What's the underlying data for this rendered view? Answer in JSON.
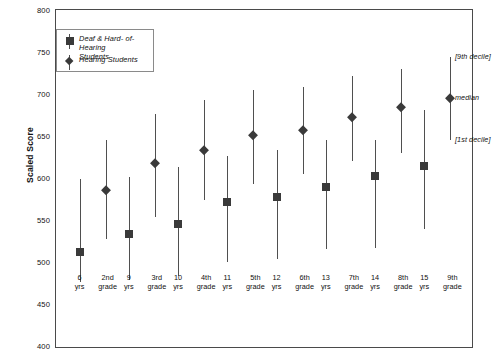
{
  "chart_data": {
    "type": "scatter",
    "title": "",
    "xlabel": "",
    "ylabel": "Scaled Score",
    "ylim": [
      400,
      800
    ],
    "ytick_labels": [
      "800",
      "750",
      "700",
      "650",
      "600",
      "550",
      "500",
      "450",
      "400"
    ],
    "ytick_values": [
      800,
      750,
      700,
      650,
      600,
      550,
      500,
      450,
      400
    ],
    "grid": false,
    "legend_position": "top-left",
    "categories": [
      {
        "age": "6",
        "age_unit": "yrs",
        "grade": "2nd",
        "grade_unit": "grade"
      },
      {
        "age": "9",
        "age_unit": "yrs",
        "grade": "3rd",
        "grade_unit": "grade"
      },
      {
        "age": "10",
        "age_unit": "yrs",
        "grade": "4th",
        "grade_unit": "grade"
      },
      {
        "age": "11",
        "age_unit": "yrs",
        "grade": "5th",
        "grade_unit": "grade"
      },
      {
        "age": "12",
        "age_unit": "yrs",
        "grade": "6th",
        "grade_unit": "grade"
      },
      {
        "age": "13",
        "age_unit": "yrs",
        "grade": "7th",
        "grade_unit": "grade"
      },
      {
        "age": "14",
        "age_unit": "yrs",
        "grade": "8th",
        "grade_unit": "grade"
      },
      {
        "age": "15",
        "age_unit": "yrs",
        "grade": "9th",
        "grade_unit": "grade"
      }
    ],
    "series": [
      {
        "name": "Deaf & Hard- of-Hearing Students",
        "marker": "square",
        "color": "#3a3a3a",
        "categories": [
          "6 yrs",
          "9 yrs",
          "10 yrs",
          "11 yrs",
          "12 yrs",
          "13 yrs",
          "14 yrs",
          "15 yrs"
        ],
        "median": [
          513,
          535,
          547,
          573,
          578,
          590,
          604,
          615
        ],
        "decile1": [
          477,
          480,
          484,
          501,
          505,
          517,
          518,
          540
        ],
        "decile9": [
          600,
          602,
          614,
          627,
          635,
          646,
          646,
          682
        ]
      },
      {
        "name": "Hearing Students",
        "marker": "diamond",
        "color": "#3a3a3a",
        "categories": [
          "2nd grade",
          "3rd grade",
          "4th grade",
          "5th grade",
          "6th grade",
          "7th grade",
          "8th grade",
          "9th grade"
        ],
        "median": [
          587,
          619,
          635,
          652,
          658,
          674,
          686,
          696
        ],
        "decile1": [
          529,
          555,
          575,
          594,
          606,
          622,
          631,
          647
        ],
        "decile9": [
          646,
          677,
          694,
          706,
          709,
          723,
          731,
          745
        ]
      }
    ],
    "annotations": [
      {
        "label": "[9th decile]",
        "value": 745
      },
      {
        "label": "median",
        "value": 696
      },
      {
        "label": "[1st decile]",
        "value": 647
      }
    ]
  },
  "legend": {
    "items": [
      {
        "label_line1": "Deaf & Hard- of-Hearing",
        "label_line2": "Students",
        "marker": "square"
      },
      {
        "label_line1": "Hearing Students",
        "label_line2": "",
        "marker": "diamond"
      }
    ]
  }
}
